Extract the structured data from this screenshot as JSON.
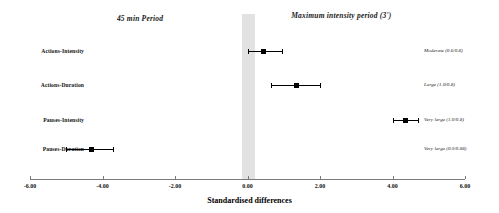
{
  "chart_data": {
    "type": "scatter",
    "title": "",
    "xlabel": "Standardised differences",
    "ylabel": "",
    "xlim": [
      -6.0,
      6.0
    ],
    "grid": false,
    "legend_position": "none",
    "null_band": {
      "from": -0.15,
      "to": 0.22,
      "color": "#e2e2e2"
    },
    "group_headers": [
      {
        "text": "45 min Period",
        "x": -2.5
      },
      {
        "text": "Maximum intensity period (3')",
        "x": 3.0
      }
    ],
    "xticks": [
      -6.0,
      -4.0,
      -2.0,
      0.0,
      2.0,
      4.0,
      6.0
    ],
    "xticklabels": [
      "-6.00",
      "-4.00",
      "-2.00",
      "0.00",
      "2.00",
      "4.00",
      "6.00"
    ],
    "categories": [
      "Actions-Intensity",
      "Actions-Duration",
      "Pauses-Intensity",
      "Pauses-Duration"
    ],
    "points": [
      {
        "label": "Actions-Intensity",
        "value": 0.45,
        "ci_low": 0.02,
        "ci_high": 0.95,
        "annotation": "Moderate (0.6/0.8)"
      },
      {
        "label": "Actions-Duration",
        "value": 1.35,
        "ci_low": 0.65,
        "ci_high": 2.0,
        "annotation": "Large (1.0/0.8)"
      },
      {
        "label": "Pauses-Intensity",
        "value": 4.35,
        "ci_low": 4.0,
        "ci_high": 4.7,
        "annotation": "Very large (1.0/0.8)"
      },
      {
        "label": "Pauses-Duration",
        "value": -4.3,
        "ci_low": -5.0,
        "ci_high": -3.7,
        "annotation": "Very large (0.9/0.88)"
      }
    ]
  }
}
